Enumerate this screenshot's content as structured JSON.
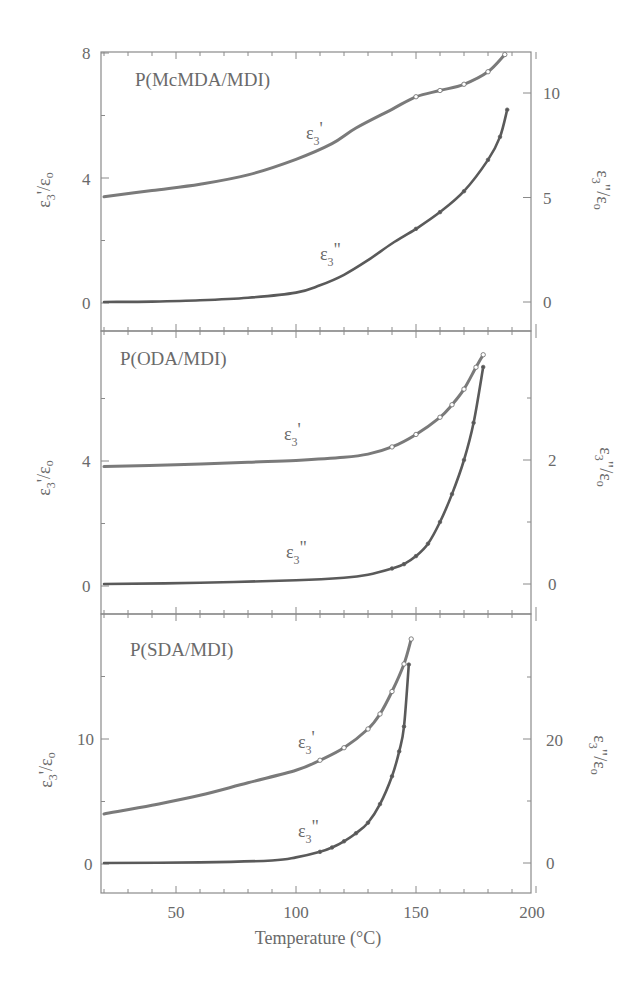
{
  "figure": {
    "xlabel": "Temperature (°C)",
    "x_ticks": [
      50,
      100,
      150,
      200
    ],
    "x_range": [
      20,
      200
    ]
  },
  "chart_data": [
    {
      "type": "line",
      "title": "P(McMDA/MDI)",
      "xlabel": "Temperature (°C)",
      "ylabel": "ε3'/εo",
      "ylabel_right": "ε3\"/εo",
      "xlim": [
        20,
        200
      ],
      "ylim": [
        0,
        8
      ],
      "ylim_right": [
        -0.5,
        12.5
      ],
      "yticks": [
        0,
        4,
        8
      ],
      "yticks_right": [
        0,
        5,
        10
      ],
      "grid": false,
      "series": [
        {
          "name": "ε3'",
          "axis": "left",
          "marker": "open-circle",
          "x": [
            20,
            40,
            60,
            80,
            100,
            115,
            125,
            140,
            150,
            160,
            170,
            180,
            187
          ],
          "values": [
            3.4,
            3.6,
            3.8,
            4.1,
            4.6,
            5.1,
            5.6,
            6.2,
            6.6,
            6.8,
            7.0,
            7.4,
            7.95
          ]
        },
        {
          "name": "ε3\"",
          "axis": "right",
          "marker": "filled-circle",
          "x": [
            20,
            40,
            60,
            80,
            100,
            110,
            120,
            130,
            140,
            150,
            160,
            170,
            180,
            185,
            188
          ],
          "values": [
            0,
            0.02,
            0.08,
            0.2,
            0.45,
            0.8,
            1.3,
            2.0,
            2.8,
            3.5,
            4.3,
            5.3,
            6.8,
            7.9,
            9.2
          ]
        }
      ],
      "annotations": [
        {
          "text": "ε3'",
          "x": 90,
          "y_left": 5.3
        },
        {
          "text": "ε3\"",
          "x": 112,
          "y_right": 2.0
        }
      ]
    },
    {
      "type": "line",
      "title": "P(ODA/MDI)",
      "xlabel": "Temperature (°C)",
      "ylabel": "ε3'/εo",
      "ylabel_right": "ε3\"/εo",
      "xlim": [
        20,
        200
      ],
      "ylim": [
        -0.8,
        8
      ],
      "ylim_right": [
        -0.4,
        4
      ],
      "yticks": [
        0,
        4
      ],
      "yticks_right": [
        0,
        2
      ],
      "grid": false,
      "series": [
        {
          "name": "ε3'",
          "axis": "left",
          "marker": "open-circle",
          "x": [
            20,
            50,
            80,
            100,
            120,
            130,
            140,
            150,
            160,
            165,
            170,
            175,
            178
          ],
          "values": [
            3.82,
            3.88,
            3.96,
            4.02,
            4.12,
            4.22,
            4.45,
            4.85,
            5.4,
            5.8,
            6.3,
            7.0,
            7.4
          ]
        },
        {
          "name": "ε3\"",
          "axis": "right",
          "marker": "filled-circle",
          "x": [
            20,
            60,
            100,
            120,
            130,
            140,
            145,
            150,
            155,
            160,
            165,
            170,
            174,
            178
          ],
          "values": [
            0,
            0.02,
            0.06,
            0.1,
            0.15,
            0.25,
            0.32,
            0.45,
            0.65,
            1.0,
            1.45,
            2.0,
            2.6,
            3.5
          ]
        }
      ],
      "annotations": [
        {
          "text": "ε3'",
          "x": 90,
          "y_left": 4.7
        },
        {
          "text": "ε3\"",
          "x": 92,
          "y_right": 0.4
        }
      ]
    },
    {
      "type": "line",
      "title": "P(SDA/MDI)",
      "xlabel": "Temperature (°C)",
      "ylabel": "ε3'/εo",
      "ylabel_right": "ε3\"/εo",
      "xlim": [
        20,
        200
      ],
      "ylim": [
        -2.3,
        20
      ],
      "ylim_right": [
        -4.6,
        40
      ],
      "yticks": [
        0,
        10
      ],
      "yticks_right": [
        0,
        20
      ],
      "grid": false,
      "series": [
        {
          "name": "ε3'",
          "axis": "left",
          "marker": "open-circle",
          "x": [
            20,
            40,
            60,
            80,
            100,
            110,
            120,
            130,
            135,
            140,
            145,
            148
          ],
          "values": [
            4.0,
            4.7,
            5.5,
            6.5,
            7.5,
            8.3,
            9.3,
            10.8,
            12.0,
            13.8,
            16.0,
            18.0
          ]
        },
        {
          "name": "ε3\"",
          "axis": "right",
          "marker": "filled-circle",
          "x": [
            20,
            60,
            90,
            100,
            110,
            115,
            120,
            125,
            130,
            135,
            140,
            143,
            145,
            147
          ],
          "values": [
            0,
            0.1,
            0.4,
            0.9,
            1.8,
            2.5,
            3.5,
            4.8,
            6.5,
            9.5,
            14.0,
            18.0,
            22.0,
            32.0
          ]
        }
      ],
      "annotations": [
        {
          "text": "ε3'",
          "x": 108,
          "y_left": 11.0
        },
        {
          "text": "ε3\"",
          "x": 108,
          "y_right": 5.0
        }
      ]
    }
  ],
  "panels": [
    {
      "title": "P(McMDA/MDI)",
      "left_label": "ε3'/εo",
      "right_label": "ε3\"/εo",
      "left_ticks": [
        "0",
        "4",
        "8"
      ],
      "right_ticks": [
        "0",
        "5",
        "10"
      ],
      "curve1_label": "ε",
      "curve1_sub": "3",
      "curve1_sup": "'",
      "curve2_label": "ε",
      "curve2_sub": "3",
      "curve2_sup": "\""
    },
    {
      "title": "P(ODA/MDI)",
      "left_label": "ε3'/εo",
      "right_label": "ε3\"/εo",
      "left_ticks": [
        "0",
        "4"
      ],
      "right_ticks": [
        "0",
        "2"
      ],
      "curve1_label": "ε",
      "curve1_sub": "3",
      "curve1_sup": "'",
      "curve2_label": "ε",
      "curve2_sub": "3",
      "curve2_sup": "\""
    },
    {
      "title": "P(SDA/MDI)",
      "left_label": "ε3'/εo",
      "right_label": "ε3\"/εo",
      "left_ticks": [
        "0",
        "10"
      ],
      "right_ticks": [
        "0",
        "20"
      ],
      "curve1_label": "ε",
      "curve1_sub": "3",
      "curve1_sup": "'",
      "curve2_label": "ε",
      "curve2_sub": "3",
      "curve2_sup": "\""
    }
  ],
  "x_tick_labels": [
    "50",
    "100",
    "150",
    "200"
  ]
}
